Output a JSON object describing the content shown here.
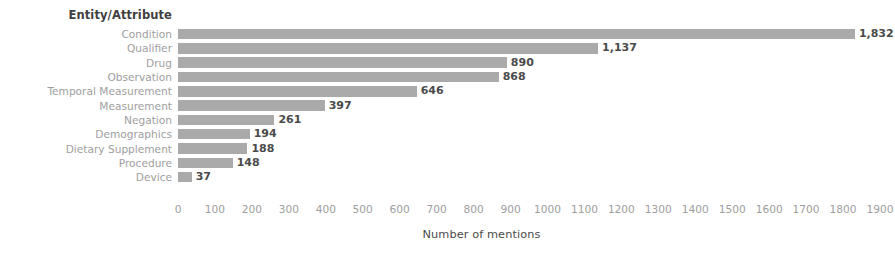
{
  "chart_data": {
    "type": "bar",
    "orientation": "horizontal",
    "title": "",
    "ylabel": "Entity/Attribute",
    "xlabel": "Number of mentions",
    "xlim": [
      0,
      1900
    ],
    "xticks": [
      0,
      100,
      200,
      300,
      400,
      500,
      600,
      700,
      800,
      900,
      1000,
      1100,
      1200,
      1300,
      1400,
      1500,
      1600,
      1700,
      1800,
      1900
    ],
    "xtick_labels": [
      "0",
      "100",
      "200",
      "300",
      "400",
      "500",
      "600",
      "700",
      "800",
      "900",
      "1000",
      "1100",
      "1200",
      "1300",
      "1400",
      "1500",
      "1600",
      "1700",
      "1800",
      "1900"
    ],
    "grid": false,
    "legend": false,
    "bar_color": "#aaaaaa",
    "label_color": "#4a4a4a",
    "axis_text_color": "#9e9e9e",
    "categories": [
      "Condition",
      "Qualifier",
      "Drug",
      "Observation",
      "Temporal Measurement",
      "Measurement",
      "Negation",
      "Demographics",
      "Dietary Supplement",
      "Procedure",
      "Device"
    ],
    "values": [
      1832,
      1137,
      890,
      868,
      646,
      397,
      261,
      194,
      188,
      148,
      37
    ],
    "value_labels": [
      "1,832",
      "1,137",
      "890",
      "868",
      "646",
      "397",
      "261",
      "194",
      "188",
      "148",
      "37"
    ]
  }
}
